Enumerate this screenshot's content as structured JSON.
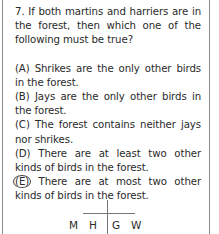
{
  "question": {
    "number": "7.",
    "text": "7. If both martins and harriers are in the forest, then which one of the following must be true?"
  },
  "options": [
    {
      "label": "(A)",
      "text": "(A) Shrikes are the only other birds in the forest."
    },
    {
      "label": "(B)",
      "text": "(B) Jays are the only other birds in the forest."
    },
    {
      "label": "(C)",
      "text": "(C) The forest contains neither jays nor shrikes."
    },
    {
      "label": "(D)",
      "text": "(D) There are at least two other kinds of birds in the forest."
    },
    {
      "label": "(E)",
      "letter": "E",
      "text": " There are at most two other kinds of birds in the forest.",
      "circled": true
    }
  ],
  "diagram": {
    "left": [
      "M",
      "H"
    ],
    "right": [
      "G",
      "W"
    ]
  }
}
